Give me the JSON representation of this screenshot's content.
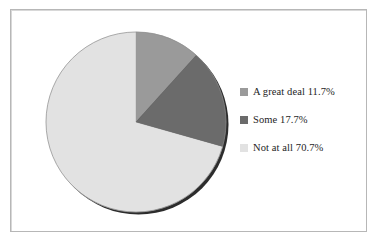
{
  "figure": {
    "background_color": "#ffffff",
    "frame_color": "#b7b7b7"
  },
  "chart_data": {
    "type": "pie",
    "title": "",
    "subtitle": "",
    "xlabel": "",
    "ylabel": "",
    "grid": false,
    "legend_position": "right",
    "start_angle_deg": 0,
    "direction": "clockwise",
    "categories": [
      "A great deal",
      "Some",
      "Not at all"
    ],
    "values": [
      11.7,
      17.7,
      70.7
    ],
    "value_unit": "%",
    "colors": [
      "#9a9a9a",
      "#6b6b6b",
      "#e2e2e2"
    ],
    "slices": [
      {
        "label": "A great deal",
        "value": 11.7,
        "display_value": "11.7%",
        "legend_text": "A great deal 11.7%",
        "color": "#9a9a9a",
        "angle_deg": 42.1
      },
      {
        "label": "Some",
        "value": 17.7,
        "display_value": "17.7%",
        "legend_text": "Some 17.7%",
        "color": "#6b6b6b",
        "angle_deg": 63.7
      },
      {
        "label": "Not at all",
        "value": 70.7,
        "display_value": "70.7%",
        "legend_text": "Not at all 70.7%",
        "color": "#e2e2e2",
        "angle_deg": 254.5
      }
    ]
  },
  "legend": {
    "entries": [
      {
        "swatch_name": "legend-swatch-a-great-deal",
        "color": "#9a9a9a",
        "text": "A great deal 11.7%"
      },
      {
        "swatch_name": "legend-swatch-some",
        "color": "#6b6b6b",
        "text": "Some 17.7%"
      },
      {
        "swatch_name": "legend-swatch-not-at-all",
        "color": "#e2e2e2",
        "text": "Not at all 70.7%"
      }
    ]
  }
}
